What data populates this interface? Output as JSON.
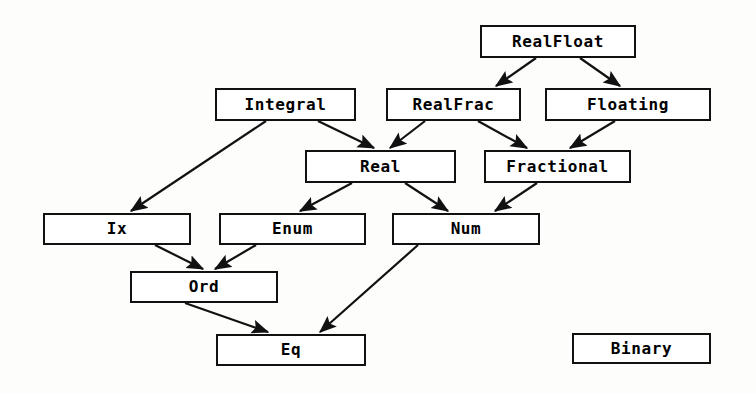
{
  "diagram": {
    "background_color": "#fdfdfc",
    "line_color": "#111111",
    "box_fill_color": "#ffffff",
    "nodes": [
      {
        "id": "realfloat",
        "label": "RealFloat",
        "x": 480,
        "y": 25,
        "w": 156,
        "h": 33
      },
      {
        "id": "integral",
        "label": "Integral",
        "x": 215,
        "y": 88,
        "w": 141,
        "h": 33
      },
      {
        "id": "realfrac",
        "label": "RealFrac",
        "x": 386,
        "y": 88,
        "w": 135,
        "h": 33
      },
      {
        "id": "floating",
        "label": "Floating",
        "x": 545,
        "y": 88,
        "w": 166,
        "h": 33
      },
      {
        "id": "real",
        "label": "Real",
        "x": 305,
        "y": 150,
        "w": 151,
        "h": 33
      },
      {
        "id": "fractional",
        "label": "Fractional",
        "x": 484,
        "y": 150,
        "w": 147,
        "h": 33
      },
      {
        "id": "ix",
        "label": "Ix",
        "x": 43,
        "y": 213,
        "w": 148,
        "h": 32
      },
      {
        "id": "enum",
        "label": "Enum",
        "x": 219,
        "y": 213,
        "w": 147,
        "h": 32
      },
      {
        "id": "num",
        "label": "Num",
        "x": 392,
        "y": 213,
        "w": 148,
        "h": 32
      },
      {
        "id": "ord",
        "label": "Ord",
        "x": 130,
        "y": 271,
        "w": 148,
        "h": 32
      },
      {
        "id": "eq",
        "label": "Eq",
        "x": 216,
        "y": 334,
        "w": 150,
        "h": 32
      },
      {
        "id": "binary",
        "label": "Binary",
        "x": 572,
        "y": 333,
        "w": 139,
        "h": 31
      }
    ],
    "edges": [
      {
        "from": "realfloat",
        "to": "realfrac",
        "x1": 536,
        "y1": 58,
        "x2": 496,
        "y2": 86
      },
      {
        "from": "realfloat",
        "to": "floating",
        "x1": 580,
        "y1": 58,
        "x2": 620,
        "y2": 86
      },
      {
        "from": "integral",
        "to": "ix",
        "x1": 266,
        "y1": 121,
        "x2": 131,
        "y2": 211
      },
      {
        "from": "integral",
        "to": "real",
        "x1": 318,
        "y1": 121,
        "x2": 374,
        "y2": 148
      },
      {
        "from": "realfrac",
        "to": "real",
        "x1": 425,
        "y1": 121,
        "x2": 390,
        "y2": 148
      },
      {
        "from": "realfrac",
        "to": "fractional",
        "x1": 478,
        "y1": 121,
        "x2": 527,
        "y2": 148
      },
      {
        "from": "floating",
        "to": "fractional",
        "x1": 615,
        "y1": 121,
        "x2": 570,
        "y2": 148
      },
      {
        "from": "real",
        "to": "enum",
        "x1": 352,
        "y1": 183,
        "x2": 300,
        "y2": 211
      },
      {
        "from": "real",
        "to": "num",
        "x1": 405,
        "y1": 183,
        "x2": 448,
        "y2": 211
      },
      {
        "from": "fractional",
        "to": "num",
        "x1": 537,
        "y1": 183,
        "x2": 495,
        "y2": 211
      },
      {
        "from": "ix",
        "to": "ord",
        "x1": 155,
        "y1": 245,
        "x2": 203,
        "y2": 269
      },
      {
        "from": "enum",
        "to": "ord",
        "x1": 256,
        "y1": 245,
        "x2": 215,
        "y2": 269
      },
      {
        "from": "ord",
        "to": "eq",
        "x1": 185,
        "y1": 303,
        "x2": 268,
        "y2": 332
      },
      {
        "from": "num",
        "to": "eq",
        "x1": 418,
        "y1": 245,
        "x2": 320,
        "y2": 332
      }
    ]
  }
}
